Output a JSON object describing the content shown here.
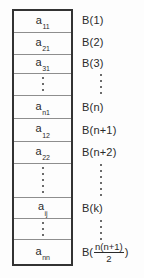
{
  "diagram": {
    "colors": {
      "background": "#fdfdfd",
      "outer_border": "#333333",
      "inner_line": "#8e8e8e",
      "text": "#2a2a2a"
    },
    "array": {
      "cells": [
        {
          "base": "a",
          "sub": "11"
        },
        {
          "base": "a",
          "sub": "21"
        },
        {
          "base": "a",
          "sub": "31"
        },
        {
          "base": "a",
          "sub": "n1"
        },
        {
          "base": "a",
          "sub": "12"
        },
        {
          "base": "a",
          "sub": "22"
        },
        {
          "base": "a",
          "sub": "ij"
        },
        {
          "base": "a",
          "sub": "nn"
        }
      ]
    },
    "labels": {
      "items": [
        "B(1)",
        "B(2)",
        "B(3)",
        "B(n)",
        "B(n+1)",
        "B(n+2)",
        "B(k)"
      ],
      "last": {
        "prefix": "B(",
        "numerator": "n(n+1)",
        "denominator": "2",
        "suffix": ")"
      }
    }
  }
}
